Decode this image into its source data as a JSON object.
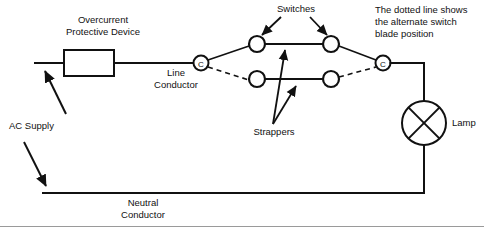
{
  "diagram": {
    "background_color": "#ffffff",
    "line_color": "#111111",
    "labels": {
      "overcurrent_device": "Overcurrent\nProtective Device",
      "line_conductor": "Line\nConductor",
      "neutral_conductor": "Neutral\nConductor",
      "ac_supply": "AC Supply",
      "switches": "Switches",
      "strappers": "Strappers",
      "lamp": "Lamp",
      "dotted_note": "The dotted line shows\nthe alternate switch\nblade position"
    },
    "terminals": {
      "common_marker": "C",
      "left_common_label": "C",
      "right_common_label": "C"
    },
    "components": [
      {
        "name": "overcurrent-protective-device",
        "type": "fuse",
        "shape": "rectangle"
      },
      {
        "name": "switch-left",
        "type": "two-way-switch",
        "contacts": 2
      },
      {
        "name": "switch-right",
        "type": "two-way-switch",
        "contacts": 2
      },
      {
        "name": "lamp",
        "type": "lamp",
        "shape": "circle-with-x"
      }
    ],
    "wires": [
      {
        "name": "line-conductor",
        "style": "solid"
      },
      {
        "name": "neutral-conductor",
        "style": "solid"
      },
      {
        "name": "strapper-upper",
        "style": "solid"
      },
      {
        "name": "strapper-lower",
        "style": "solid"
      },
      {
        "name": "switch-blade-left-solid",
        "style": "solid"
      },
      {
        "name": "switch-blade-left-dashed",
        "style": "dashed"
      },
      {
        "name": "switch-blade-right-solid",
        "style": "solid"
      },
      {
        "name": "switch-blade-right-dashed",
        "style": "dashed"
      }
    ]
  }
}
